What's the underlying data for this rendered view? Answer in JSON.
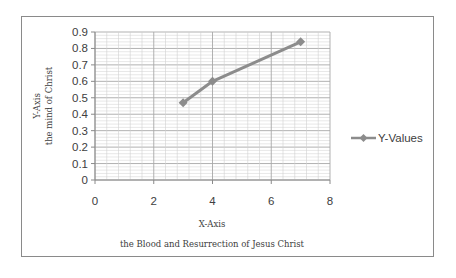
{
  "chart_data": {
    "type": "line",
    "title": "",
    "xlabel": [
      "X-Axis",
      "the Blood and Resurrection of Jesus Christ"
    ],
    "ylabel": [
      "Y-Axis",
      "the mind of Christ"
    ],
    "xlim": [
      0,
      8
    ],
    "ylim": [
      0,
      0.9
    ],
    "xticks": [
      0,
      2,
      4,
      6,
      8
    ],
    "yticks": [
      0,
      0.1,
      0.2,
      0.3,
      0.4,
      0.5,
      0.6,
      0.7,
      0.8,
      0.9
    ],
    "grid": true,
    "legend_position": "right",
    "series": [
      {
        "name": "Y-Values",
        "color": "#8c8c8c",
        "marker": "diamond",
        "x": [
          3,
          4,
          7
        ],
        "y": [
          0.47,
          0.6,
          0.84
        ]
      }
    ]
  },
  "labels": {
    "x_title_1": "X-Axis",
    "x_title_2": "the Blood and Resurrection of Jesus Christ",
    "y_title_1": "Y-Axis",
    "y_title_2": "the mind of Christ",
    "legend_label": "Y-Values"
  }
}
